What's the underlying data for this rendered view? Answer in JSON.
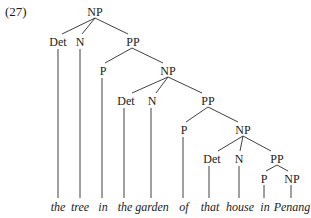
{
  "example_number": "(27)",
  "tree": {
    "nodes": [
      {
        "id": "np1",
        "label": "NP",
        "x": 95,
        "y": 15
      },
      {
        "id": "det1",
        "label": "Det",
        "x": 58,
        "y": 45
      },
      {
        "id": "n1",
        "label": "N",
        "x": 80,
        "y": 45
      },
      {
        "id": "pp1",
        "label": "PP",
        "x": 133,
        "y": 45
      },
      {
        "id": "p1",
        "label": "P",
        "x": 103,
        "y": 74
      },
      {
        "id": "np2",
        "label": "NP",
        "x": 168,
        "y": 74
      },
      {
        "id": "det2",
        "label": "Det",
        "x": 126,
        "y": 104
      },
      {
        "id": "n2",
        "label": "N",
        "x": 152,
        "y": 104
      },
      {
        "id": "pp2",
        "label": "PP",
        "x": 208,
        "y": 104
      },
      {
        "id": "p2",
        "label": "P",
        "x": 184,
        "y": 133
      },
      {
        "id": "np3",
        "label": "NP",
        "x": 243,
        "y": 133
      },
      {
        "id": "det3",
        "label": "Det",
        "x": 212,
        "y": 162
      },
      {
        "id": "n3",
        "label": "N",
        "x": 238,
        "y": 162
      },
      {
        "id": "pp3",
        "label": "PP",
        "x": 277,
        "y": 162
      },
      {
        "id": "p3",
        "label": "P",
        "x": 264,
        "y": 181
      },
      {
        "id": "np4",
        "label": "NP",
        "x": 291,
        "y": 181
      }
    ],
    "words": [
      {
        "text": "the",
        "x": 58
      },
      {
        "text": "tree",
        "x": 80
      },
      {
        "text": "in",
        "x": 103
      },
      {
        "text": "the",
        "x": 126
      },
      {
        "text": "garden",
        "x": 152
      },
      {
        "text": "of",
        "x": 184
      },
      {
        "text": "that",
        "x": 212
      },
      {
        "text": "house",
        "x": 238
      },
      {
        "text": "in",
        "x": 264
      },
      {
        "text": "Penang",
        "x": 291
      }
    ]
  }
}
